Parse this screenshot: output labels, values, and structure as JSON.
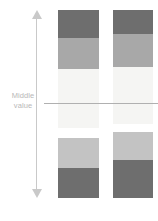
{
  "figure": {
    "type": "diverging-stacked-bar-illustration",
    "background": "#ffffff"
  },
  "axis": {
    "name": "vertical-double-arrow",
    "arrow_top": "up-arrow",
    "arrow_bottom": "down-arrow",
    "color": "#c9c9c9",
    "x": 36,
    "top": 10,
    "bottom": 198
  },
  "middle_marker": {
    "label_line_1": "Middle",
    "label_line_2": "value",
    "label_color": "#b8b8b8",
    "rule_color": "#b0b0b0",
    "rule_y": 103,
    "rule_x_start": 44,
    "rule_x_end": 158
  },
  "palette": {
    "dark_gray": "#6e6e6e",
    "medium_gray": "#a8a8a8",
    "near_white": "#f5f5f3",
    "light_gray": "#c3c3c3"
  },
  "chart_data": {
    "type": "bar",
    "title": "",
    "subtitle": "",
    "xlabel": "",
    "ylabel": "",
    "grid": false,
    "legend": null,
    "annotations": [
      {
        "text": "Middle value",
        "type": "axis-reference-line",
        "y_px": 103
      }
    ],
    "orientation": "vertical-stacked-diverging",
    "categories": [
      "Column 1",
      "Column 2"
    ],
    "series": [
      {
        "name": "Band 1 (dark gray)",
        "color": "#6e6e6e",
        "values": [
          28,
          24
        ]
      },
      {
        "name": "Band 2 (medium gray)",
        "color": "#a8a8a8",
        "values": [
          31,
          33
        ]
      },
      {
        "name": "Band 3 (near white)",
        "color": "#f5f5f3",
        "values": [
          59,
          57
        ]
      },
      {
        "name": "Band 4 (light gray)",
        "color": "#c3c3c3",
        "values": [
          30,
          28
        ]
      },
      {
        "name": "Band 5 (dark gray)",
        "color": "#6e6e6e",
        "values": [
          30,
          38
        ]
      }
    ],
    "columns": [
      {
        "name": "left-column",
        "x": 58,
        "width": 41,
        "segments": [
          {
            "band": "dark-gray-top",
            "color": "#6e6e6e",
            "top": 10,
            "height": 28
          },
          {
            "band": "medium-gray",
            "color": "#a8a8a8",
            "top": 38,
            "height": 31
          },
          {
            "band": "near-white",
            "color": "#f5f5f3",
            "top": 69,
            "height": 59
          },
          {
            "band": "light-gray",
            "color": "#c3c3c3",
            "top": 138,
            "height": 30
          },
          {
            "band": "dark-gray-bottom",
            "color": "#6e6e6e",
            "top": 168,
            "height": 30
          }
        ]
      },
      {
        "name": "right-column",
        "x": 113,
        "width": 40,
        "segments": [
          {
            "band": "dark-gray-top",
            "color": "#6e6e6e",
            "top": 10,
            "height": 24
          },
          {
            "band": "medium-gray",
            "color": "#a8a8a8",
            "top": 34,
            "height": 33
          },
          {
            "band": "near-white",
            "color": "#f5f5f3",
            "top": 67,
            "height": 57
          },
          {
            "band": "light-gray",
            "color": "#c3c3c3",
            "top": 132,
            "height": 28
          },
          {
            "band": "dark-gray-bottom",
            "color": "#6e6e6e",
            "top": 160,
            "height": 38
          }
        ]
      }
    ],
    "ylim": [
      0,
      188
    ]
  }
}
